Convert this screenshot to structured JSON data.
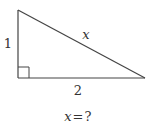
{
  "diagram": {
    "type": "right-triangle",
    "vertices": {
      "top": [
        18,
        10
      ],
      "right_angle": [
        18,
        78
      ],
      "right": [
        145,
        78
      ]
    },
    "right_angle_marker_size": 11,
    "labels": {
      "vertical_leg": "1",
      "horizontal_leg": "2",
      "hypotenuse": "x"
    },
    "question": {
      "variable": "x",
      "equals": "=",
      "unknown": "?"
    },
    "stroke_color": "#444444"
  }
}
